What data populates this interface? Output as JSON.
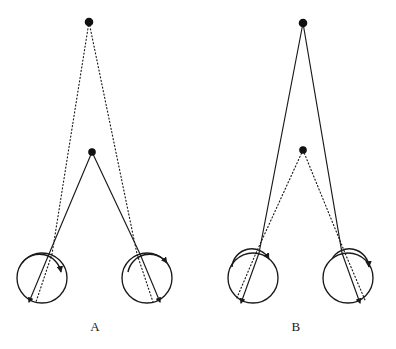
{
  "figure": {
    "title": "",
    "background_color": "#ffffff",
    "line_color": "#1a1a1a",
    "width": 396,
    "height": 349
  },
  "panels": [
    {
      "id": "panel-a",
      "label": "A",
      "label_pos": {
        "x": 95,
        "y": 331
      },
      "far_point": {
        "x": 89,
        "y": 22,
        "radius": 3.6,
        "style": "filled-dot"
      },
      "near_point": {
        "x": 92,
        "y": 152,
        "radius": 3.2,
        "style": "filled-dot"
      },
      "fixation_lines_style": "solid",
      "fixation_target": "near_point",
      "dotted_lines_style": "dotted",
      "dotted_target": "far_point",
      "eyes": [
        {
          "side": "left",
          "center": {
            "x": 42,
            "y": 278
          },
          "radius": 25,
          "cornea": {
            "arc_start": {
              "x": 22,
              "y": 263
            },
            "arc_end": {
              "x": 61,
              "y": 272
            },
            "bulge": 13
          },
          "pupil_entry": {
            "x": 49,
            "y": 254
          },
          "fovea": {
            "x": 29,
            "y": 302
          },
          "dotted_entry": {
            "x": 52,
            "y": 254
          },
          "dotted_fovea": {
            "x": 36,
            "y": 302
          }
        },
        {
          "side": "right",
          "center": {
            "x": 147,
            "y": 278
          },
          "radius": 25,
          "cornea": {
            "arc_start": {
              "x": 128,
              "y": 272
            },
            "arc_end": {
              "x": 167,
              "y": 263
            },
            "bulge": 13
          },
          "pupil_entry": {
            "x": 140,
            "y": 254
          },
          "fovea": {
            "x": 160,
            "y": 302
          },
          "dotted_entry": {
            "x": 137,
            "y": 254
          },
          "dotted_fovea": {
            "x": 153,
            "y": 302
          }
        }
      ]
    },
    {
      "id": "panel-b",
      "label": "B",
      "label_pos": {
        "x": 296,
        "y": 331
      },
      "far_point": {
        "x": 303,
        "y": 23,
        "radius": 3.6,
        "style": "filled-dot"
      },
      "near_point": {
        "x": 303,
        "y": 150,
        "radius": 3.2,
        "style": "filled-dot"
      },
      "fixation_lines_style": "solid",
      "fixation_target": "far_point",
      "dotted_lines_style": "dotted",
      "dotted_target": "near_point",
      "eyes": [
        {
          "side": "left",
          "center": {
            "x": 253,
            "y": 278
          },
          "radius": 25,
          "cornea": {
            "arc_start": {
              "x": 232,
              "y": 267
            },
            "arc_end": {
              "x": 269,
              "y": 259
            },
            "bulge": 14
          },
          "pupil_entry": {
            "x": 259,
            "y": 253
          },
          "fovea": {
            "x": 241,
            "y": 303
          },
          "dotted_entry": {
            "x": 256,
            "y": 253
          },
          "dotted_fovea": {
            "x": 236,
            "y": 300
          }
        },
        {
          "side": "right",
          "center": {
            "x": 348,
            "y": 278
          },
          "radius": 25,
          "cornea": {
            "arc_start": {
              "x": 332,
              "y": 259
            },
            "arc_end": {
              "x": 369,
              "y": 267
            },
            "bulge": 14
          },
          "pupil_entry": {
            "x": 342,
            "y": 253
          },
          "fovea": {
            "x": 360,
            "y": 303
          },
          "dotted_entry": {
            "x": 345,
            "y": 253
          },
          "dotted_fovea": {
            "x": 365,
            "y": 300
          }
        }
      ]
    }
  ],
  "chart_data": {
    "type": "diagram",
    "panel_labels": [
      "A",
      "B"
    ],
    "elements": {
      "solid_lines": "visual axes to the fixated target",
      "dotted_lines": "visual axes to the non-fixated target",
      "filled_dots": "point targets in space",
      "circles": "eyeball globes",
      "arcs": "corneas",
      "arrowheads": "foveal termination of each visual axis"
    },
    "panel_a": {
      "fixated": "near point",
      "near_point_y": 152,
      "far_point_y": 22,
      "eye_separation_px": 105
    },
    "panel_b": {
      "fixated": "far point",
      "near_point_y": 150,
      "far_point_y": 23,
      "eye_separation_px": 95
    }
  }
}
